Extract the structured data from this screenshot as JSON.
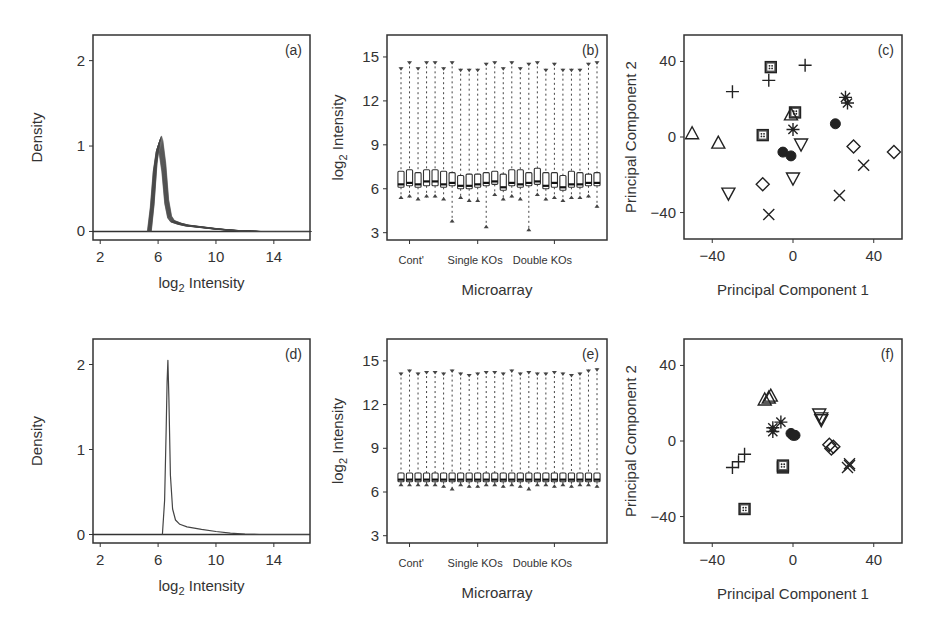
{
  "figure": {
    "panels": [
      "a",
      "b",
      "c",
      "d",
      "e",
      "f"
    ]
  },
  "chart_data": [
    {
      "id": "a",
      "type": "line",
      "panel_label": "(a)",
      "title": "",
      "xlabel": "log2 Intensity",
      "xlabel_main": "log",
      "xlabel_sub": "2",
      "xlabel_rest": " Intensity",
      "ylabel": "Density",
      "xlim": [
        1.5,
        16.5
      ],
      "ylim": [
        -0.1,
        2.3
      ],
      "xticks": [
        2,
        6,
        10,
        14
      ],
      "yticks": [
        0,
        1,
        2
      ],
      "grid": false,
      "description": "Overlaid kernel density curves of 24 raw microarrays; peaks near log2 intensity 6 with density ~1.0-1.1, long right tail to ~14",
      "series": [
        {
          "name": "arrays (overlaid, 24)",
          "x": [
            5.4,
            5.6,
            5.8,
            6.0,
            6.1,
            6.2,
            6.4,
            6.6,
            6.8,
            7.0,
            7.5,
            8.0,
            9.0,
            10.0,
            11.0,
            12.0,
            13.0,
            14.0,
            16.5
          ],
          "y": [
            0.0,
            0.3,
            0.75,
            1.0,
            1.05,
            1.0,
            0.75,
            0.35,
            0.17,
            0.12,
            0.09,
            0.07,
            0.05,
            0.03,
            0.015,
            0.005,
            0.0,
            0.0,
            0.0
          ]
        }
      ]
    },
    {
      "id": "b",
      "type": "box",
      "panel_label": "(b)",
      "xlabel": "Microarray",
      "ylabel": "log2 Intensity",
      "ylabel_main": "log",
      "ylabel_sub": "2",
      "ylabel_rest": " Intensity",
      "ylim": [
        2.5,
        16.5
      ],
      "yticks": [
        3,
        6,
        9,
        12,
        15
      ],
      "group_labels": [
        "Cont'",
        "Single KOs",
        "Double KOs"
      ],
      "n_arrays": 24,
      "boxes": {
        "q1": [
          6.1,
          6.2,
          6.1,
          6.2,
          6.2,
          6.1,
          6.2,
          6.0,
          6.0,
          6.1,
          6.2,
          6.3,
          5.9,
          6.2,
          6.1,
          6.2,
          6.3,
          6.0,
          6.1,
          5.9,
          6.1,
          6.1,
          6.2,
          6.2
        ],
        "median": [
          6.3,
          6.4,
          6.3,
          6.5,
          6.5,
          6.3,
          6.4,
          6.2,
          6.2,
          6.3,
          6.4,
          6.5,
          6.1,
          6.4,
          6.3,
          6.4,
          6.5,
          6.2,
          6.4,
          6.1,
          6.3,
          6.3,
          6.4,
          6.4
        ],
        "q3": [
          7.2,
          7.3,
          7.1,
          7.3,
          7.3,
          7.2,
          7.1,
          6.9,
          7.0,
          7.0,
          7.1,
          7.2,
          7.0,
          7.3,
          7.3,
          7.1,
          7.4,
          7.1,
          7.1,
          6.9,
          7.2,
          7.1,
          7.0,
          7.1
        ],
        "lower_whisker": [
          5.3,
          5.4,
          5.2,
          5.4,
          5.4,
          5.2,
          3.7,
          5.3,
          5.1,
          5.1,
          3.3,
          5.5,
          5.2,
          5.4,
          5.2,
          3.1,
          5.5,
          5.2,
          5.3,
          5.1,
          5.3,
          5.3,
          5.4,
          4.7
        ],
        "upper_whisker": [
          14.3,
          14.7,
          14.3,
          14.7,
          14.7,
          14.3,
          14.7,
          14.2,
          14.2,
          14.2,
          14.6,
          14.7,
          14.3,
          14.7,
          14.3,
          14.6,
          14.7,
          14.2,
          14.6,
          14.2,
          14.2,
          14.2,
          14.6,
          14.7
        ]
      }
    },
    {
      "id": "c",
      "type": "scatter",
      "panel_label": "(c)",
      "xlabel": "Principal Component 1",
      "ylabel": "Principal Component 2",
      "xlim": [
        -54,
        54
      ],
      "ylim": [
        -54,
        54
      ],
      "xticks": [
        -40,
        0,
        40
      ],
      "yticks": [
        -40,
        0,
        40
      ],
      "series": [
        {
          "name": "plus",
          "marker": "plus",
          "points": [
            [
              -30,
              24
            ],
            [
              -12,
              30
            ],
            [
              6,
              38
            ]
          ]
        },
        {
          "name": "boxed-dot",
          "marker": "boxed",
          "points": [
            [
              -11,
              37
            ],
            [
              1,
              13
            ],
            [
              -15,
              1
            ]
          ]
        },
        {
          "name": "triangle-up",
          "marker": "triangle-up",
          "points": [
            [
              -50,
              2
            ],
            [
              -37,
              -3
            ],
            [
              -1,
              12
            ]
          ]
        },
        {
          "name": "asterisk",
          "marker": "asterisk",
          "points": [
            [
              0,
              4
            ],
            [
              26,
              21
            ],
            [
              27,
              18
            ]
          ]
        },
        {
          "name": "filled-circle",
          "marker": "circle-filled",
          "points": [
            [
              21,
              7
            ],
            [
              -5,
              -8
            ],
            [
              -1,
              -10
            ]
          ]
        },
        {
          "name": "triangle-down",
          "marker": "triangle-down",
          "points": [
            [
              4,
              -4
            ],
            [
              0,
              -22
            ],
            [
              -32,
              -30
            ]
          ]
        },
        {
          "name": "diamond",
          "marker": "diamond",
          "points": [
            [
              -15,
              -25
            ],
            [
              30,
              -5
            ],
            [
              50,
              -8
            ]
          ]
        },
        {
          "name": "cross",
          "marker": "cross",
          "points": [
            [
              35,
              -15
            ],
            [
              23,
              -31
            ],
            [
              -12,
              -41
            ]
          ]
        }
      ]
    },
    {
      "id": "d",
      "type": "line",
      "panel_label": "(d)",
      "xlabel": "log2 Intensity",
      "xlabel_main": "log",
      "xlabel_sub": "2",
      "xlabel_rest": " Intensity",
      "ylabel": "Density",
      "xlim": [
        1.5,
        16.5
      ],
      "ylim": [
        -0.1,
        2.3
      ],
      "xticks": [
        2,
        6,
        10,
        14
      ],
      "yticks": [
        0,
        1,
        2
      ],
      "grid": false,
      "description": "Quantile-normalized density curves (24 arrays coincide); sharp peak at log2 intensity ~6.7 with density ~2.05",
      "series": [
        {
          "name": "arrays (normalized, coincident)",
          "x": [
            6.3,
            6.45,
            6.55,
            6.62,
            6.68,
            6.75,
            6.85,
            7.0,
            7.2,
            7.5,
            8.0,
            9.0,
            10.0,
            11.0,
            12.0,
            13.0,
            14.0,
            16.5
          ],
          "y": [
            0.0,
            0.4,
            1.2,
            1.8,
            2.05,
            1.6,
            0.7,
            0.3,
            0.17,
            0.12,
            0.09,
            0.06,
            0.035,
            0.015,
            0.005,
            0.0,
            0.0,
            0.0
          ]
        }
      ]
    },
    {
      "id": "e",
      "type": "box",
      "panel_label": "(e)",
      "xlabel": "Microarray",
      "ylabel": "log2 Intensity",
      "ylabel_main": "log",
      "ylabel_sub": "2",
      "ylabel_rest": " Intensity",
      "ylim": [
        2.5,
        16.5
      ],
      "yticks": [
        3,
        6,
        9,
        12,
        15
      ],
      "group_labels": [
        "Cont'",
        "Single KOs",
        "Double KOs"
      ],
      "n_arrays": 24,
      "boxes": {
        "q1": [
          6.7,
          6.7,
          6.7,
          6.7,
          6.7,
          6.7,
          6.7,
          6.7,
          6.7,
          6.7,
          6.7,
          6.7,
          6.7,
          6.7,
          6.7,
          6.7,
          6.7,
          6.7,
          6.7,
          6.7,
          6.7,
          6.7,
          6.7,
          6.7
        ],
        "median": [
          6.85,
          6.85,
          6.85,
          6.85,
          6.85,
          6.85,
          6.85,
          6.85,
          6.85,
          6.85,
          6.85,
          6.85,
          6.85,
          6.85,
          6.85,
          6.85,
          6.85,
          6.85,
          6.85,
          6.85,
          6.85,
          6.85,
          6.85,
          6.85
        ],
        "q3": [
          7.3,
          7.3,
          7.3,
          7.3,
          7.3,
          7.3,
          7.3,
          7.3,
          7.3,
          7.3,
          7.3,
          7.3,
          7.3,
          7.3,
          7.3,
          7.3,
          7.3,
          7.3,
          7.3,
          7.3,
          7.3,
          7.3,
          7.3,
          7.3
        ],
        "lower_whisker": [
          6.4,
          6.4,
          6.4,
          6.4,
          6.4,
          6.3,
          6.1,
          6.4,
          6.3,
          6.3,
          6.4,
          6.4,
          6.3,
          6.4,
          6.3,
          6.1,
          6.4,
          6.4,
          6.3,
          6.4,
          6.3,
          6.4,
          6.4,
          6.3
        ],
        "upper_whisker": [
          14.2,
          14.4,
          14.2,
          14.3,
          14.3,
          14.2,
          14.4,
          14.2,
          14.1,
          14.2,
          14.3,
          14.3,
          14.2,
          14.4,
          14.2,
          14.3,
          14.2,
          14.2,
          14.3,
          14.2,
          14.1,
          14.2,
          14.4,
          14.5
        ]
      }
    },
    {
      "id": "f",
      "type": "scatter",
      "panel_label": "(f)",
      "xlabel": "Principal Component 1",
      "ylabel": "Principal Component 2",
      "xlim": [
        -54,
        54
      ],
      "ylim": [
        -54,
        54
      ],
      "xticks": [
        -40,
        0,
        40
      ],
      "yticks": [
        -40,
        0,
        40
      ],
      "series": [
        {
          "name": "plus",
          "marker": "plus",
          "points": [
            [
              -30,
              -14
            ],
            [
              -27,
              -11
            ],
            [
              -24,
              -7
            ]
          ]
        },
        {
          "name": "boxed-dot",
          "marker": "boxed",
          "points": [
            [
              -24,
              -36
            ],
            [
              -5,
              -14
            ],
            [
              -5,
              -13
            ]
          ]
        },
        {
          "name": "triangle-up",
          "marker": "triangle-up",
          "points": [
            [
              -14,
              22
            ],
            [
              -12,
              23
            ],
            [
              -11,
              24
            ]
          ]
        },
        {
          "name": "asterisk",
          "marker": "asterisk",
          "points": [
            [
              -10,
              5
            ],
            [
              -10,
              7
            ],
            [
              -6,
              10
            ]
          ]
        },
        {
          "name": "filled-circle",
          "marker": "circle-filled",
          "points": [
            [
              -1,
              4
            ],
            [
              0,
              3
            ],
            [
              1,
              3
            ]
          ]
        },
        {
          "name": "triangle-down",
          "marker": "triangle-down",
          "points": [
            [
              13,
              14
            ],
            [
              14,
              12
            ],
            [
              14,
              11
            ]
          ]
        },
        {
          "name": "diamond",
          "marker": "diamond",
          "points": [
            [
              18,
              -2
            ],
            [
              19,
              -4
            ],
            [
              20,
              -3
            ]
          ]
        },
        {
          "name": "cross",
          "marker": "cross",
          "points": [
            [
              27,
              -14
            ],
            [
              28,
              -12
            ],
            [
              28,
              -13
            ]
          ]
        }
      ]
    }
  ]
}
